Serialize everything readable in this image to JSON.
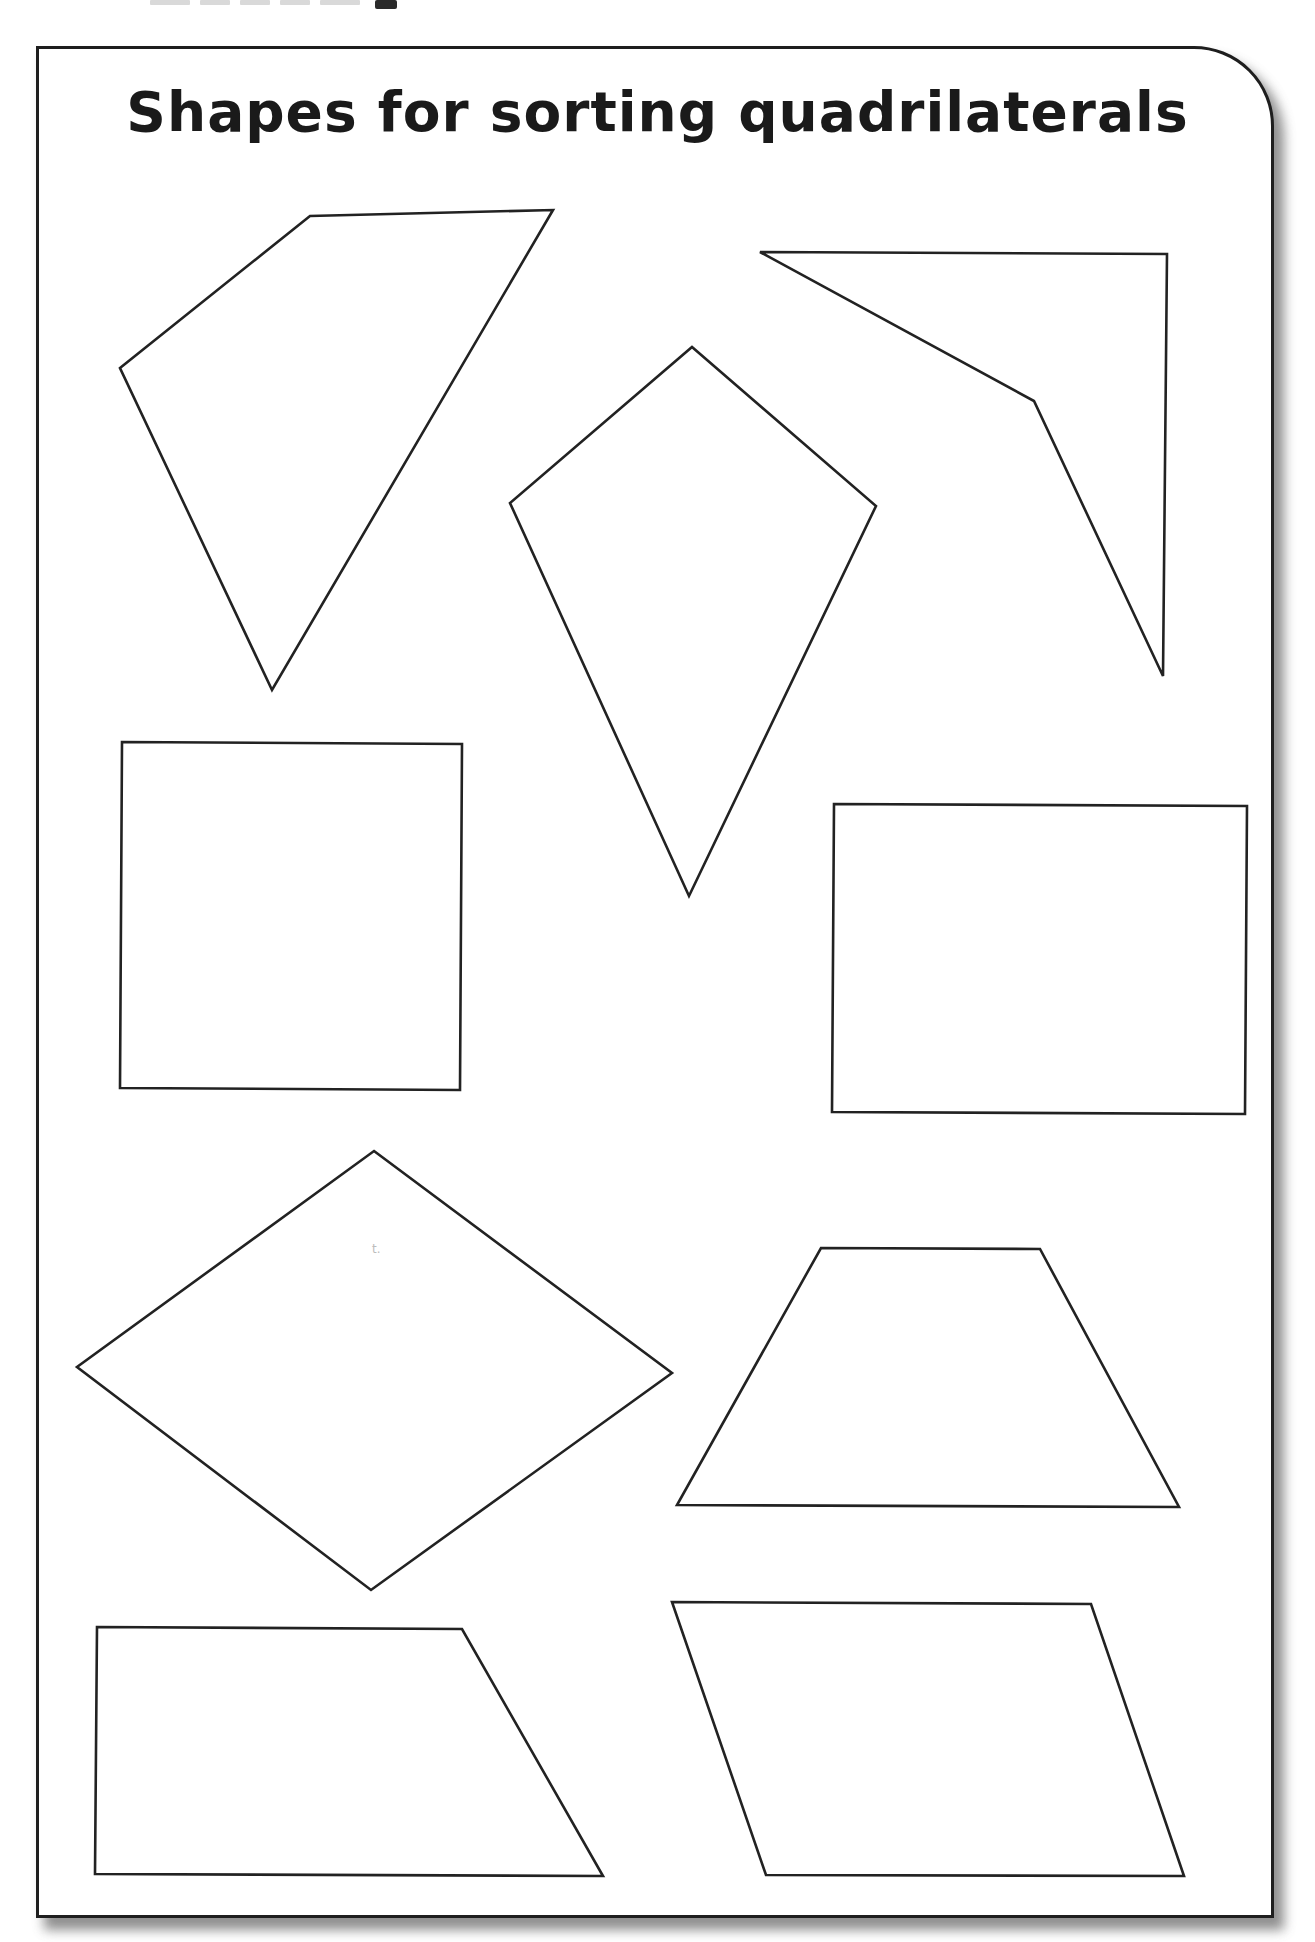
{
  "worksheet": {
    "title": "Shapes for sorting quadrilaterals",
    "colors": {
      "outline": "#222222",
      "paper": "#ffffff",
      "border": "#1e1e1e",
      "shadow": "#6a6a6a"
    },
    "shapes": [
      {
        "name": "irregular-quadrilateral",
        "points": "120,368 310,216 553,210 272,690"
      },
      {
        "name": "kite",
        "points": "692,347 876,506 689,896 510,503"
      },
      {
        "name": "arrowhead",
        "points": "760,252 1167,254 1163,676 1034,401"
      },
      {
        "name": "square",
        "points": "122,742 462,744 460,1090 120,1088"
      },
      {
        "name": "rectangle",
        "points": "834,804 1247,806 1245,1114 832,1112"
      },
      {
        "name": "rhombus",
        "points": "374,1151 672,1373 371,1590 77,1367"
      },
      {
        "name": "trapezium",
        "points": "821,1248 1040,1249 1179,1507 677,1505"
      },
      {
        "name": "right-trapezium",
        "points": "97,1627 462,1629 603,1876 95,1874"
      },
      {
        "name": "parallelogram",
        "points": "672,1602 1091,1604 1184,1876 766,1875"
      }
    ],
    "stray_mark": "t."
  }
}
